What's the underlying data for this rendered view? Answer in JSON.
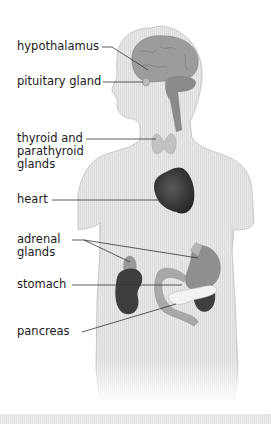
{
  "figure": {
    "title_hidden": "",
    "colors": {
      "body_fill": "#e6e6e6",
      "body_outline": "#bdbdbd",
      "brain": "#9a9a9a",
      "cerebellum": "#888888",
      "gland_light": "#bcbcbc",
      "heart": "#3a3a3a",
      "kidney": "#3d3d3d",
      "stomach": "#8e8e8e",
      "pancreas": "#f2f2f2",
      "leader_line": "#333333"
    },
    "labels": [
      {
        "id": "hypothalamus",
        "text": "hypothalamus"
      },
      {
        "id": "pituitary",
        "text": "pituitary gland"
      },
      {
        "id": "thyroid",
        "text": "thyroid and\nparathyroid\nglands"
      },
      {
        "id": "heart",
        "text": "heart"
      },
      {
        "id": "adrenal",
        "text": "adrenal\nglands"
      },
      {
        "id": "stomach",
        "text": "stomach"
      },
      {
        "id": "pancreas",
        "text": "pancreas"
      }
    ]
  }
}
